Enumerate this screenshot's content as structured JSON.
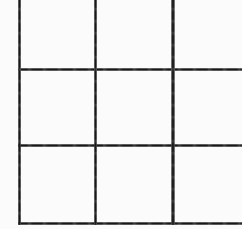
{
  "image": {
    "kind": "scanned-grid",
    "description": "Scanned black-and-white grid of ruled lines, cropped at the top and right edges",
    "width": 242,
    "height": 229,
    "background_color": "#fdfdfd",
    "line_color": "#1a1a1a",
    "line_color_light": "#808080"
  },
  "grid": {
    "columns_visible": 3,
    "rows_visible": 3,
    "cropped_edges": [
      "top",
      "right"
    ],
    "vertical_lines": [
      {
        "name": "vertical-line-1",
        "x": 18,
        "thickness": 3,
        "y_start": 0,
        "y_end": 225
      },
      {
        "name": "vertical-line-2",
        "x": 94,
        "thickness": 3,
        "y_start": 0,
        "y_end": 225
      },
      {
        "name": "vertical-line-3",
        "x": 171,
        "thickness": 4,
        "y_start": 0,
        "y_end": 225
      }
    ],
    "horizontal_lines": [
      {
        "name": "horizontal-line-1",
        "y": 68,
        "thickness": 3,
        "x_start": 18,
        "x_end": 242
      },
      {
        "name": "horizontal-line-2",
        "y": 144,
        "thickness": 3,
        "x_start": 18,
        "x_end": 242
      },
      {
        "name": "horizontal-line-3",
        "y": 222,
        "thickness": 3,
        "x_start": 18,
        "x_end": 242
      }
    ],
    "cells": [
      {
        "name": "cell-r1c1",
        "x": 21,
        "y": 0,
        "width": 73,
        "height": 68,
        "label": ""
      },
      {
        "name": "cell-r1c2",
        "x": 97,
        "y": 0,
        "width": 74,
        "height": 68,
        "label": ""
      },
      {
        "name": "cell-r1c3",
        "x": 175,
        "y": 0,
        "width": 67,
        "height": 68,
        "label": ""
      },
      {
        "name": "cell-r2c1",
        "x": 21,
        "y": 71,
        "width": 73,
        "height": 73,
        "label": ""
      },
      {
        "name": "cell-r2c2",
        "x": 97,
        "y": 71,
        "width": 74,
        "height": 73,
        "label": ""
      },
      {
        "name": "cell-r2c3",
        "x": 175,
        "y": 71,
        "width": 67,
        "height": 73,
        "label": ""
      },
      {
        "name": "cell-r3c1",
        "x": 21,
        "y": 147,
        "width": 73,
        "height": 75,
        "label": ""
      },
      {
        "name": "cell-r3c2",
        "x": 97,
        "y": 147,
        "width": 74,
        "height": 75,
        "label": ""
      },
      {
        "name": "cell-r3c3",
        "x": 175,
        "y": 147,
        "width": 67,
        "height": 75,
        "label": ""
      }
    ]
  }
}
